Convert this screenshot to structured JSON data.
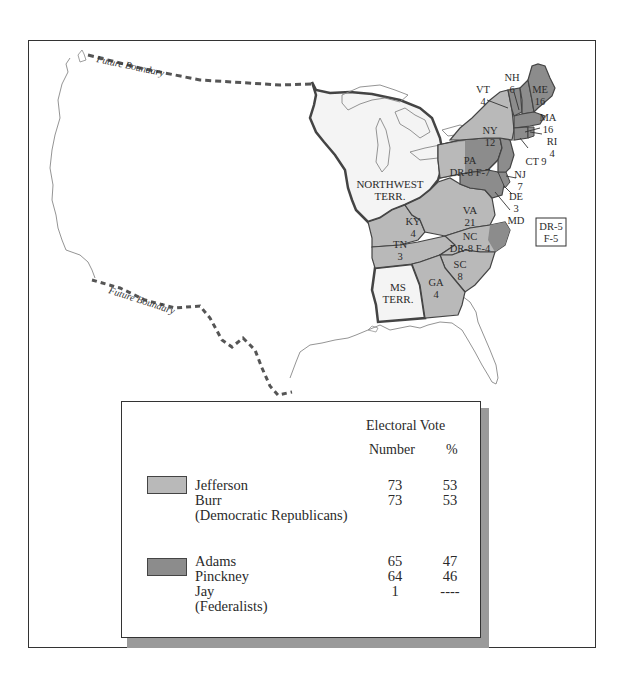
{
  "map": {
    "labels": {
      "future_boundary_north": "Future Boundary",
      "future_boundary_south": "Future Boundary",
      "northwest_terr": [
        "NORTHWEST",
        "TERR."
      ],
      "ms_terr": [
        "MS",
        "TERR."
      ],
      "md_box": [
        "DR-5",
        "F-5"
      ]
    },
    "states": [
      {
        "abbr": "NH",
        "votes": "6"
      },
      {
        "abbr": "VT",
        "votes": "4"
      },
      {
        "abbr": "ME",
        "votes": "16"
      },
      {
        "abbr": "MA",
        "votes": "16"
      },
      {
        "abbr": "RI",
        "votes": "4"
      },
      {
        "abbr": "CT",
        "votes": "9"
      },
      {
        "abbr": "NY",
        "votes": "12"
      },
      {
        "abbr": "PA",
        "votes": "DR-8 F-7"
      },
      {
        "abbr": "NJ",
        "votes": "7"
      },
      {
        "abbr": "DE",
        "votes": "3"
      },
      {
        "abbr": "MD",
        "votes": ""
      },
      {
        "abbr": "VA",
        "votes": "21"
      },
      {
        "abbr": "KY",
        "votes": "4"
      },
      {
        "abbr": "NC",
        "votes": "DR-8 F-4"
      },
      {
        "abbr": "TN",
        "votes": "3"
      },
      {
        "abbr": "SC",
        "votes": "8"
      },
      {
        "abbr": "GA",
        "votes": "4"
      }
    ],
    "colors": {
      "democratic_republican": "#b9b9b9",
      "federalist": "#8c8c8c",
      "territory": "#f4f4f4",
      "border": "#444444"
    }
  },
  "legend": {
    "header_line1": "Electoral Vote",
    "header_number": "Number",
    "header_pct": "%",
    "groups": [
      {
        "party": "(Democratic Republicans)",
        "candidates": [
          {
            "name": "Jefferson",
            "number": "73",
            "pct": "53"
          },
          {
            "name": "Burr",
            "number": "73",
            "pct": "53"
          }
        ]
      },
      {
        "party": "(Federalists)",
        "candidates": [
          {
            "name": "Adams",
            "number": "65",
            "pct": "47"
          },
          {
            "name": "Pinckney",
            "number": "64",
            "pct": "46"
          },
          {
            "name": "Jay",
            "number": "1",
            "pct": "----"
          }
        ]
      }
    ]
  }
}
